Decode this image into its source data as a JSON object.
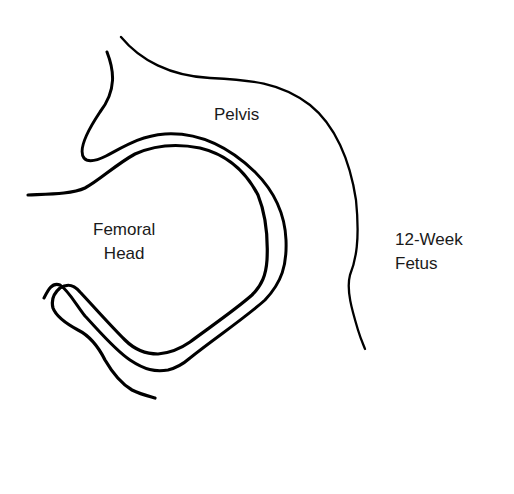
{
  "diagram": {
    "type": "anatomical-line-drawing",
    "labels": {
      "pelvis": "Pelvis",
      "femoral_head_line1": "Femoral",
      "femoral_head_line2": "Head",
      "fetus_line1": "12-Week",
      "fetus_line2": "Fetus"
    },
    "colors": {
      "line": "#000000",
      "text": "#1a1a1a",
      "background": "#ffffff"
    }
  }
}
